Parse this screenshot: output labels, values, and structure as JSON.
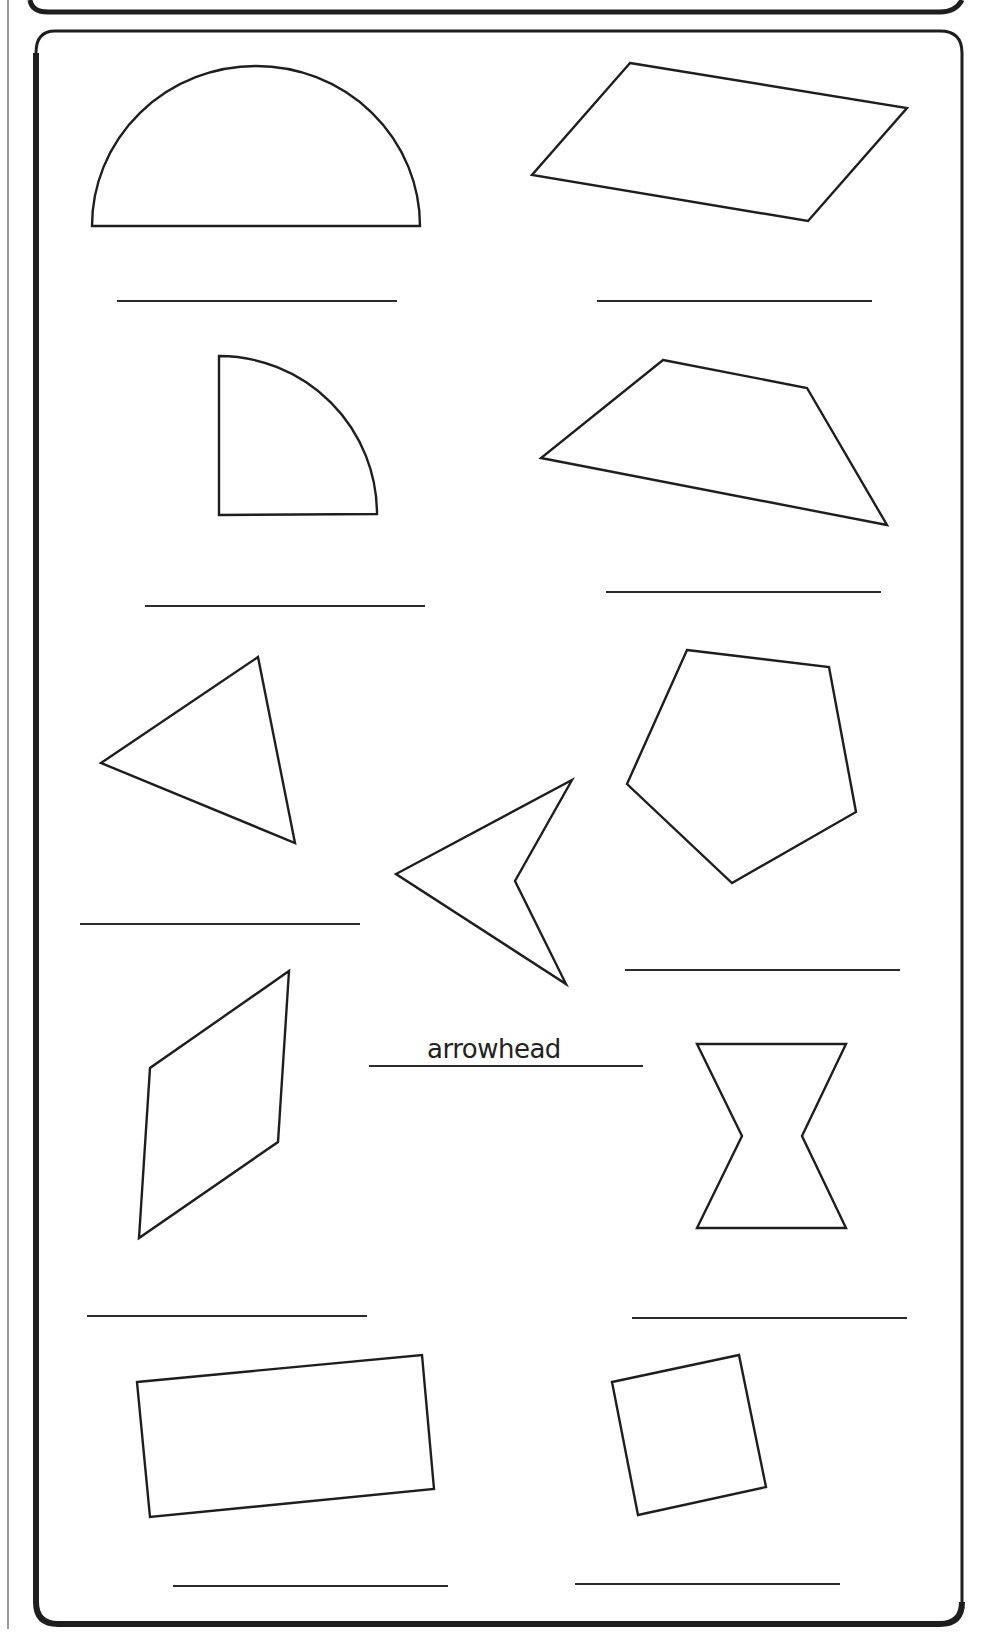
{
  "worksheet": {
    "colors": {
      "ink": "#1e1e1e",
      "background": "#ffffff"
    },
    "shapes": [
      {
        "id": "semicircle",
        "answer": ""
      },
      {
        "id": "parallelogram",
        "answer": ""
      },
      {
        "id": "quarter-circle",
        "answer": ""
      },
      {
        "id": "trapezoid",
        "answer": ""
      },
      {
        "id": "triangle",
        "answer": ""
      },
      {
        "id": "arrowhead",
        "answer": "arrowhead"
      },
      {
        "id": "pentagon",
        "answer": ""
      },
      {
        "id": "rhombus",
        "answer": ""
      },
      {
        "id": "hourglass",
        "answer": ""
      },
      {
        "id": "rectangle",
        "answer": ""
      },
      {
        "id": "square",
        "answer": ""
      }
    ],
    "example_answer": "arrowhead"
  }
}
